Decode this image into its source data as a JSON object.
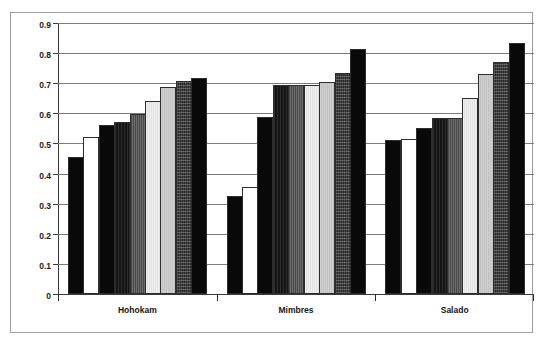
{
  "page": {
    "title": "",
    "caption": ""
  },
  "chart_data": {
    "type": "bar",
    "title": "",
    "subtitle": "",
    "xlabel": "",
    "ylabel": "",
    "ylim": [
      0,
      0.9
    ],
    "ytick_values": [
      0,
      0.1,
      0.2,
      0.3,
      0.4,
      0.5,
      0.6,
      0.7,
      0.8,
      0.9
    ],
    "ytick_labels": [
      "0",
      "0.1",
      "0.2",
      "0.3",
      "0.4",
      "0.5",
      "0.6",
      "0.7",
      "0.8",
      "0.9"
    ],
    "grid": true,
    "grid_axis": "y",
    "legend": false,
    "legend_position": "none",
    "categories": [
      "Hohokam",
      "Mimbres",
      "Salado"
    ],
    "series": [
      {
        "name": "series-1",
        "fill": "black",
        "values": [
          0.455,
          0.325,
          0.513
        ]
      },
      {
        "name": "series-2",
        "fill": "white",
        "values": [
          0.52,
          0.355,
          0.515
        ]
      },
      {
        "name": "series-3",
        "fill": "black",
        "values": [
          0.56,
          0.588,
          0.553
        ]
      },
      {
        "name": "series-4",
        "fill": "darkdense",
        "values": [
          0.57,
          0.695,
          0.585
        ]
      },
      {
        "name": "series-5",
        "fill": "darkgray-v",
        "values": [
          0.598,
          0.695,
          0.585
        ]
      },
      {
        "name": "series-6",
        "fill": "vlight",
        "values": [
          0.64,
          0.695,
          0.652
        ]
      },
      {
        "name": "series-7",
        "fill": "lightgray",
        "values": [
          0.688,
          0.703,
          0.732
        ]
      },
      {
        "name": "series-8",
        "fill": "speckle",
        "values": [
          0.707,
          0.735,
          0.772
        ]
      },
      {
        "name": "series-9",
        "fill": "black",
        "values": [
          0.717,
          0.815,
          0.833
        ]
      }
    ]
  }
}
